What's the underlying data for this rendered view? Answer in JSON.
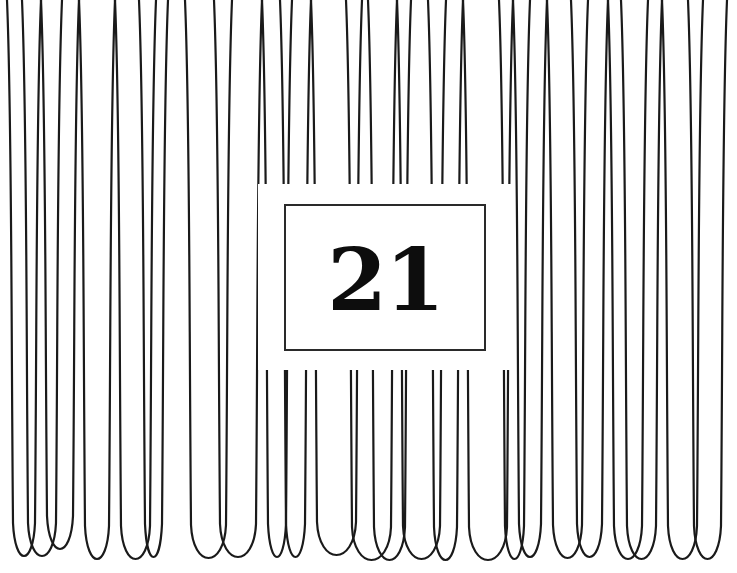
{
  "page": {
    "number": "21",
    "colors": {
      "line": "#1a1a1a",
      "box_border": "#2a2a2a",
      "background": "#ffffff"
    }
  },
  "loops": [
    {
      "x1": 7,
      "x2": 41,
      "bottom": 563
    },
    {
      "x1": 22,
      "x2": 62,
      "bottom": 563
    },
    {
      "x1": 41,
      "x2": 79,
      "bottom": 556
    },
    {
      "x1": 79,
      "x2": 115,
      "bottom": 566
    },
    {
      "x1": 115,
      "x2": 156,
      "bottom": 566
    },
    {
      "x1": 139,
      "x2": 168,
      "bottom": 564
    },
    {
      "x1": 185,
      "x2": 232,
      "bottom": 565
    },
    {
      "x1": 214,
      "x2": 262,
      "bottom": 564
    },
    {
      "x1": 262,
      "x2": 292,
      "bottom": 564
    },
    {
      "x1": 280,
      "x2": 311,
      "bottom": 564
    },
    {
      "x1": 311,
      "x2": 362,
      "bottom": 562
    },
    {
      "x1": 346,
      "x2": 397,
      "bottom": 567
    },
    {
      "x1": 368,
      "x2": 411,
      "bottom": 567
    },
    {
      "x1": 397,
      "x2": 446,
      "bottom": 566
    },
    {
      "x1": 428,
      "x2": 463,
      "bottom": 567
    },
    {
      "x1": 463,
      "x2": 513,
      "bottom": 567
    },
    {
      "x1": 499,
      "x2": 530,
      "bottom": 566
    },
    {
      "x1": 513,
      "x2": 547,
      "bottom": 564
    },
    {
      "x1": 547,
      "x2": 588,
      "bottom": 565
    },
    {
      "x1": 571,
      "x2": 608,
      "bottom": 564
    },
    {
      "x1": 608,
      "x2": 648,
      "bottom": 566
    },
    {
      "x1": 621,
      "x2": 662,
      "bottom": 566
    },
    {
      "x1": 662,
      "x2": 703,
      "bottom": 566
    },
    {
      "x1": 688,
      "x2": 727,
      "bottom": 566
    }
  ],
  "gap": {
    "top_stub_end_y": 184,
    "bottom_stub_start_y": 370,
    "left_x": 258,
    "right_x": 512
  }
}
